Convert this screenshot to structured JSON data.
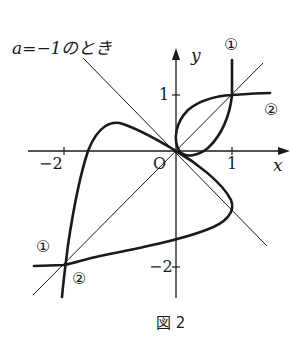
{
  "figure": {
    "annotation": "a=−1のとき",
    "caption": "図 2",
    "axes": {
      "x_label": "x",
      "y_label": "y",
      "origin_label": "O",
      "x_ticks": [
        "−2",
        "1"
      ],
      "y_ticks": [
        "1",
        "−2"
      ]
    },
    "curve_labels": {
      "curve1_top": "①",
      "curve2_right": "②",
      "curve1_bottom": "①",
      "curve2_bottom": "②"
    },
    "lines": [
      "y = x",
      "y = −x"
    ],
    "intersection_points": [
      [
        1,
        1
      ],
      [
        -2,
        -2
      ],
      [
        0,
        0
      ]
    ],
    "colors": {
      "ink": "#1a1a1a",
      "background": "#ffffff"
    }
  }
}
